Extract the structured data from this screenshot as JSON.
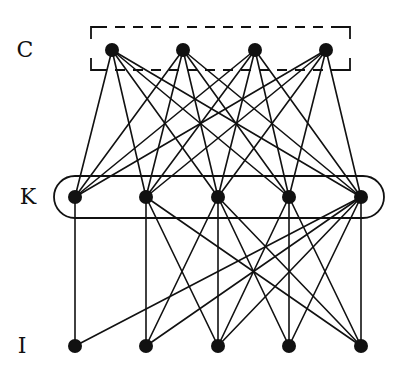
{
  "diagram": {
    "type": "layered-graph",
    "colors": {
      "ink": "#111111",
      "background": "#ffffff"
    },
    "layers": [
      {
        "id": "C",
        "label": "C",
        "label_pos": [
          25,
          50
        ],
        "y": 50,
        "nodes": [
          {
            "id": "C1",
            "x": 112
          },
          {
            "id": "C2",
            "x": 183
          },
          {
            "id": "C3",
            "x": 255
          },
          {
            "id": "C4",
            "x": 326
          }
        ],
        "group": {
          "shape": "dashed-bracket-box",
          "x1": 91,
          "y1": 27,
          "x2": 350,
          "y2": 70
        }
      },
      {
        "id": "K",
        "label": "K",
        "label_pos": [
          28,
          197
        ],
        "y": 197,
        "nodes": [
          {
            "id": "K1",
            "x": 75
          },
          {
            "id": "K2",
            "x": 146
          },
          {
            "id": "K3",
            "x": 218
          },
          {
            "id": "K4",
            "x": 289
          },
          {
            "id": "K5",
            "x": 361
          }
        ],
        "group": {
          "shape": "rounded-rect",
          "x1": 54,
          "y1": 176,
          "x2": 384,
          "y2": 218,
          "radius": 21
        }
      },
      {
        "id": "I",
        "label": "I",
        "label_pos": [
          22,
          346
        ],
        "y": 346,
        "nodes": [
          {
            "id": "I1",
            "x": 75
          },
          {
            "id": "I2",
            "x": 146
          },
          {
            "id": "I3",
            "x": 218
          },
          {
            "id": "I4",
            "x": 289
          },
          {
            "id": "I5",
            "x": 361
          }
        ]
      }
    ],
    "edges": [
      [
        "C1",
        "K1"
      ],
      [
        "C1",
        "K2"
      ],
      [
        "C1",
        "K3"
      ],
      [
        "C1",
        "K4"
      ],
      [
        "C1",
        "K5"
      ],
      [
        "C2",
        "K1"
      ],
      [
        "C2",
        "K2"
      ],
      [
        "C2",
        "K3"
      ],
      [
        "C2",
        "K4"
      ],
      [
        "C2",
        "K5"
      ],
      [
        "C3",
        "K1"
      ],
      [
        "C3",
        "K2"
      ],
      [
        "C3",
        "K3"
      ],
      [
        "C3",
        "K4"
      ],
      [
        "C3",
        "K5"
      ],
      [
        "C4",
        "K1"
      ],
      [
        "C4",
        "K2"
      ],
      [
        "C4",
        "K3"
      ],
      [
        "C4",
        "K4"
      ],
      [
        "C4",
        "K5"
      ],
      [
        "K1",
        "I1"
      ],
      [
        "K2",
        "I2"
      ],
      [
        "K2",
        "I3"
      ],
      [
        "K2",
        "I5"
      ],
      [
        "K3",
        "I2"
      ],
      [
        "K3",
        "I3"
      ],
      [
        "K3",
        "I4"
      ],
      [
        "K3",
        "I5"
      ],
      [
        "K4",
        "I3"
      ],
      [
        "K4",
        "I4"
      ],
      [
        "K4",
        "I5"
      ],
      [
        "K5",
        "I1"
      ],
      [
        "K5",
        "I2"
      ],
      [
        "K5",
        "I3"
      ],
      [
        "K5",
        "I4"
      ],
      [
        "K5",
        "I5"
      ]
    ],
    "node_radius": 7,
    "edge_width": 1.6
  }
}
